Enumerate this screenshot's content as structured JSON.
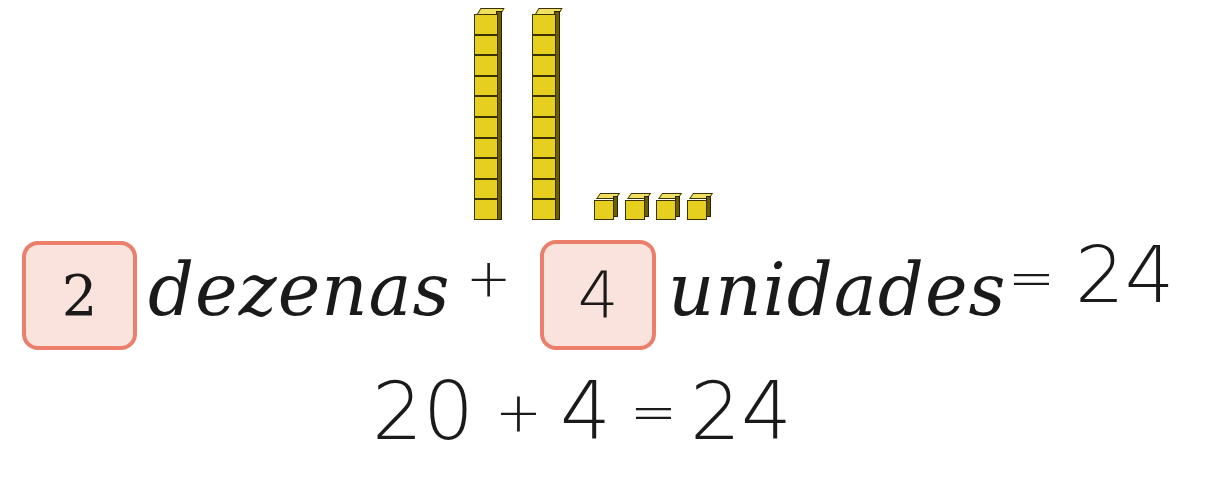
{
  "illustration": {
    "description": "Base-ten blocks representing 24",
    "tens_rods": 2,
    "cubes_per_rod": 10,
    "unit_cubes": 4,
    "colors": {
      "block_face": "#e6cf1e",
      "block_top": "#f0e060",
      "block_side": "#6e5e00",
      "outline": "#3a3200"
    }
  },
  "line1": {
    "tens_box_value": "2",
    "tens_word": "dezenas",
    "plus": "+",
    "units_box_value": "4",
    "units_word": "unidades",
    "equals": "=",
    "result": "24"
  },
  "line2": {
    "expression": "20 + 4 = 24",
    "term1": "20",
    "plus": "+",
    "term2": "4",
    "equals": "=",
    "result": "24"
  },
  "colors": {
    "box_fill": "#fbe3dd",
    "box_border": "#ec7f6b",
    "text": "#1a1a1a"
  }
}
